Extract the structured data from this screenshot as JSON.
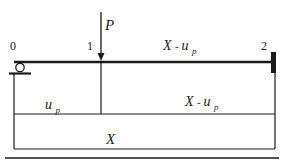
{
  "diagram": {
    "type": "beam-diagram",
    "colors": {
      "line": "#1a1a1a",
      "background": "#ffffff"
    },
    "nodes": [
      {
        "id": "node-0",
        "label": "0"
      },
      {
        "id": "node-1",
        "label": "1"
      },
      {
        "id": "node-2",
        "label": "2"
      }
    ],
    "load": {
      "label": "P"
    },
    "segments": {
      "beam_right": {
        "main": "X",
        "sep": " - ",
        "var": "u",
        "sub": "p"
      },
      "lower_left": {
        "var": "u",
        "sub": "p"
      },
      "lower_right": {
        "main": "X",
        "sep": " - ",
        "var": "u",
        "sub": "p"
      },
      "total": {
        "main": "X"
      }
    }
  }
}
